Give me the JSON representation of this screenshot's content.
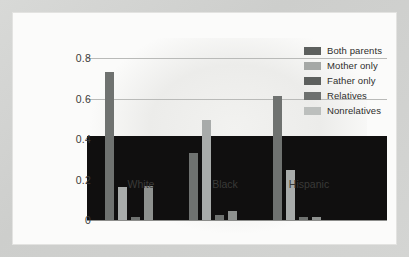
{
  "chart_data": {
    "type": "bar",
    "title": "",
    "subtitle": "",
    "xlabel": "",
    "ylabel": "",
    "categories": [
      "White",
      "Black",
      "Hispanic"
    ],
    "ylim": [
      0,
      0.8
    ],
    "yticks": [
      "0",
      "0.2",
      "0.4",
      "0.6",
      "0.8"
    ],
    "ytick_values": [
      0,
      0.2,
      0.4,
      0.6,
      0.8
    ],
    "grid": true,
    "legend_position": "top-right",
    "series": [
      {
        "name": "Both parents",
        "color": "#6f7270",
        "values": [
          0.735,
          0.335,
          0.615
        ]
      },
      {
        "name": "Mother only",
        "color": "#a8abaa",
        "values": [
          0.17,
          0.5,
          0.25
        ]
      },
      {
        "name": "Father only",
        "color": "#6f7270",
        "values": [
          0.02,
          0.03,
          0.02
        ]
      },
      {
        "name": "Relatives",
        "color": "#8e918f",
        "values": [
          0.175,
          0.048,
          0.02
        ]
      },
      {
        "name": "Nonrelatives",
        "color": "#b9bcba",
        "values": [
          0.005,
          0.006,
          0.005
        ]
      }
    ]
  },
  "legend": {
    "items": [
      {
        "label": "Both parents",
        "color": "#5d605e"
      },
      {
        "label": "Mother only",
        "color": "#a5a8a6"
      },
      {
        "label": "Father only",
        "color": "#5d605e"
      },
      {
        "label": "Relatives",
        "color": "#6d706e"
      },
      {
        "label": "Nonrelatives",
        "color": "#bcbfbd"
      }
    ]
  },
  "overlay": {
    "color": "#100f0f",
    "top_value": 0.42
  }
}
